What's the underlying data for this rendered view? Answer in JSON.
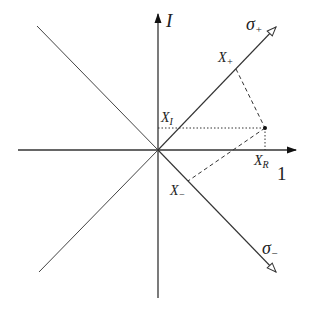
{
  "diagram": {
    "axes": {
      "vertical_label": "I",
      "horizontal_label": "1"
    },
    "rays": [
      {
        "name": "sigma-plus",
        "label": "σ",
        "subscript": "+"
      },
      {
        "name": "sigma-minus",
        "label": "σ",
        "subscript": "−"
      }
    ],
    "points": {
      "x_plus": {
        "label": "X",
        "subscript": "+"
      },
      "x_minus": {
        "label": "X",
        "subscript": "−"
      },
      "x_i": {
        "label": "X",
        "subscript": "I"
      },
      "x_r": {
        "label": "X",
        "subscript": "R"
      }
    },
    "colors": {
      "line": "#3a3a3a",
      "axis": "#222222"
    }
  }
}
